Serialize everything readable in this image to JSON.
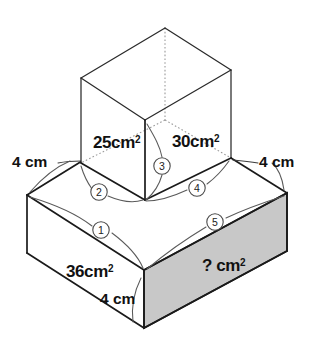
{
  "figure": {
    "background_color": "#ffffff",
    "line_color": "#1a1a1a",
    "hidden_line_color": "#9a9a9a",
    "shaded_face_color": "#c8c8c8"
  },
  "labels": {
    "top_left_area": "25cm",
    "top_left_area_sup": "2",
    "top_right_area": "30cm",
    "top_right_area_sup": "2",
    "bottom_left_area": "36cm",
    "bottom_left_area_sup": "2",
    "bottom_right_area": "? cm",
    "bottom_right_area_sup": "2",
    "dim_left": "4 cm",
    "dim_right": "4 cm",
    "dim_front": "4 cm"
  },
  "markers": [
    {
      "id": "marker-1",
      "label": "1"
    },
    {
      "id": "marker-2",
      "label": "2"
    },
    {
      "id": "marker-3",
      "label": "3"
    },
    {
      "id": "marker-4",
      "label": "4"
    },
    {
      "id": "marker-5",
      "label": "5"
    }
  ]
}
